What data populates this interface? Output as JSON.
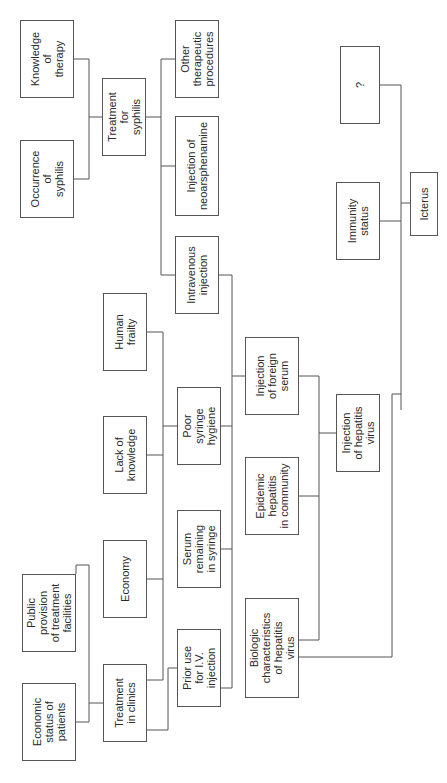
{
  "diagram": {
    "orientation": "rotated-90-ccw",
    "nodes": [
      {
        "id": "knowledge_therapy",
        "label": "Knowledge\nof\ntherapy",
        "x": 20,
        "y": 20,
        "w": 54,
        "h": 78
      },
      {
        "id": "occurrence_syphilis",
        "label": "Occurrence\nof\nsyphilis",
        "x": 20,
        "y": 140,
        "w": 54,
        "h": 78
      },
      {
        "id": "treatment_syphilis",
        "label": "Treatment\nfor\nsyphilis",
        "x": 102,
        "y": 78,
        "w": 44,
        "h": 78
      },
      {
        "id": "other_therapeutic",
        "label": "Other\ntherapeutic\nprocedures",
        "x": 175,
        "y": 20,
        "w": 44,
        "h": 78
      },
      {
        "id": "neoarsphenamine",
        "label": "Injection of\nneoarsphenamine",
        "x": 175,
        "y": 116,
        "w": 44,
        "h": 100
      },
      {
        "id": "intravenous",
        "label": "Intravenous\ninjection",
        "x": 175,
        "y": 236,
        "w": 44,
        "h": 78
      },
      {
        "id": "human_frailty",
        "label": "Human\nfrailty",
        "x": 103,
        "y": 293,
        "w": 44,
        "h": 78
      },
      {
        "id": "lack_knowledge",
        "label": "Lack of\nknowledge",
        "x": 103,
        "y": 416,
        "w": 44,
        "h": 78
      },
      {
        "id": "economy",
        "label": "Economy",
        "x": 103,
        "y": 540,
        "w": 44,
        "h": 78
      },
      {
        "id": "public_provision",
        "label": "Public\nprovision\nof treatment\nfacilities",
        "x": 22,
        "y": 574,
        "w": 54,
        "h": 78
      },
      {
        "id": "economic_status",
        "label": "Economic\nstatus of\npatients",
        "x": 22,
        "y": 683,
        "w": 54,
        "h": 78
      },
      {
        "id": "treatment_clinics",
        "label": "Treatment\nin clinics",
        "x": 103,
        "y": 664,
        "w": 44,
        "h": 78
      },
      {
        "id": "prior_use_iv",
        "label": "Prior use\nfor I.V.\ninjection",
        "x": 177,
        "y": 629,
        "w": 44,
        "h": 78
      },
      {
        "id": "serum_remaining",
        "label": "Serum\nremaining\nin syringe",
        "x": 177,
        "y": 510,
        "w": 44,
        "h": 78
      },
      {
        "id": "poor_syringe",
        "label": "Poor\nsyringe\nhygiene",
        "x": 177,
        "y": 387,
        "w": 44,
        "h": 78
      },
      {
        "id": "biologic_char",
        "label": "Biologic\ncharacteristics\nof hepatitis\nvirus",
        "x": 245,
        "y": 598,
        "w": 54,
        "h": 100
      },
      {
        "id": "epidemic_hepatitis",
        "label": "Epidemic\nhepatitis\nin community",
        "x": 245,
        "y": 457,
        "w": 54,
        "h": 78
      },
      {
        "id": "foreign_serum",
        "label": "Injection\nof foreign\nserum",
        "x": 245,
        "y": 337,
        "w": 54,
        "h": 78
      },
      {
        "id": "hepatitis_virus",
        "label": "Injection\nof hepatitis\nvirus",
        "x": 336,
        "y": 394,
        "w": 44,
        "h": 78
      },
      {
        "id": "immunity_status",
        "label": "Immunity\nstatus",
        "x": 336,
        "y": 182,
        "w": 44,
        "h": 78
      },
      {
        "id": "icterus",
        "label": "Icterus",
        "x": 410,
        "y": 172,
        "w": 28,
        "h": 64
      },
      {
        "id": "unknown",
        "label": "?",
        "x": 340,
        "y": 46,
        "w": 40,
        "h": 78
      }
    ],
    "edges": [
      {
        "from": [
          "knowledge_therapy",
          "occurrence_syphilis"
        ],
        "to": "treatment_syphilis"
      },
      {
        "from": [
          "treatment_syphilis"
        ],
        "to": [
          "other_therapeutic",
          "neoarsphenamine",
          "intravenous"
        ]
      },
      {
        "from": [
          "intravenous",
          "poor_syringe",
          "serum_remaining",
          "prior_use_iv"
        ],
        "to": "foreign_serum"
      },
      {
        "from": [
          "human_frailty",
          "lack_knowledge",
          "economy",
          "treatment_clinics"
        ],
        "to": "poor_syringe"
      },
      {
        "from": [
          "public_provision",
          "economic_status"
        ],
        "to": "treatment_clinics"
      },
      {
        "from": [
          "foreign_serum",
          "epidemic_hepatitis",
          "biologic_char"
        ],
        "to": "hepatitis_virus"
      },
      {
        "from": [
          "hepatitis_virus",
          "immunity_status",
          "unknown"
        ],
        "to": "icterus"
      }
    ]
  }
}
